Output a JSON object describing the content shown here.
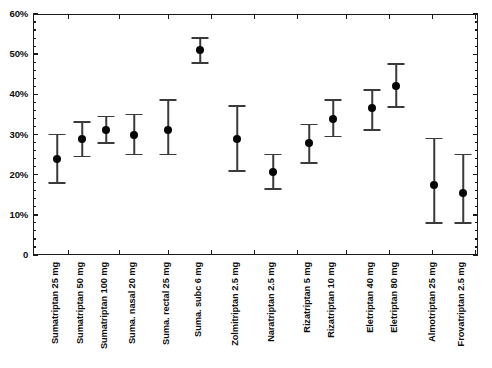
{
  "chart_data": {
    "type": "scatter",
    "title": "",
    "subtitle": "",
    "xlabel": "",
    "ylabel": "",
    "ylim": [
      0,
      60
    ],
    "ytick_values": [
      0,
      10,
      20,
      30,
      40,
      50,
      60
    ],
    "ytick_labels": [
      "0",
      "10%",
      "20%",
      "30%",
      "40%",
      "50%",
      "60%"
    ],
    "yminor_step": 2,
    "grid": false,
    "legend": false,
    "legend_position": "none",
    "error_bar_style": "capped-vertical",
    "marker_color": "#050505",
    "error_bar_color": "#3a3a3a",
    "axis_color": "#1a1a1a",
    "background_color": "#ffffff",
    "categories": [
      "Sumatriptan 25 mg",
      "Sumatriptan 50 mg",
      "Sumatriptan 100 mg",
      "Suma. nasal 20 mg",
      "Suma. rectal 25 mg",
      "Suma. subc 6 mg",
      "Zolmitriptan 2.5 mg",
      "Naratriptan 2.5 mg",
      "Rizatriptan 5 mg",
      "Rizatriptan 10 mg",
      "Eletriptan 40 mg",
      "Eletriptan 80 mg",
      "Almotriptan 25 mg",
      "Frovatriptan 2.5 mg"
    ],
    "values": [
      24.0,
      28.8,
      31.2,
      29.8,
      31.0,
      51.0,
      28.8,
      20.6,
      27.8,
      33.8,
      36.5,
      42.0,
      17.5,
      15.5
    ],
    "ci_low": [
      18.0,
      24.5,
      27.8,
      25.0,
      25.0,
      47.8,
      21.0,
      16.5,
      23.0,
      29.5,
      31.2,
      36.8,
      8.0,
      8.0
    ],
    "ci_high": [
      30.0,
      33.2,
      34.5,
      35.0,
      38.5,
      54.0,
      37.0,
      25.0,
      32.5,
      38.5,
      41.0,
      47.5,
      29.0,
      25.0
    ],
    "points": [
      {
        "category": "Sumatriptan 25 mg",
        "value": 24.0,
        "ci_low": 18.0,
        "ci_high": 30.0
      },
      {
        "category": "Sumatriptan 50 mg",
        "value": 28.8,
        "ci_low": 24.5,
        "ci_high": 33.2
      },
      {
        "category": "Sumatriptan 100 mg",
        "value": 31.2,
        "ci_low": 27.8,
        "ci_high": 34.5
      },
      {
        "category": "Suma. nasal 20 mg",
        "value": 29.8,
        "ci_low": 25.0,
        "ci_high": 35.0
      },
      {
        "category": "Suma. rectal 25 mg",
        "value": 31.0,
        "ci_low": 25.0,
        "ci_high": 38.5
      },
      {
        "category": "Suma. subc 6 mg",
        "value": 51.0,
        "ci_low": 47.8,
        "ci_high": 54.0
      },
      {
        "category": "Zolmitriptan 2.5 mg",
        "value": 28.8,
        "ci_low": 21.0,
        "ci_high": 37.0
      },
      {
        "category": "Naratriptan 2.5 mg",
        "value": 20.6,
        "ci_low": 16.5,
        "ci_high": 25.0
      },
      {
        "category": "Rizatriptan 5 mg",
        "value": 27.8,
        "ci_low": 23.0,
        "ci_high": 32.5
      },
      {
        "category": "Rizatriptan 10 mg",
        "value": 33.8,
        "ci_low": 29.5,
        "ci_high": 38.5
      },
      {
        "category": "Eletriptan 40 mg",
        "value": 36.5,
        "ci_low": 31.2,
        "ci_high": 41.0
      },
      {
        "category": "Eletriptan 80 mg",
        "value": 42.0,
        "ci_low": 36.8,
        "ci_high": 47.5
      },
      {
        "category": "Almotriptan 25 mg",
        "value": 17.5,
        "ci_low": 8.0,
        "ci_high": 29.0
      },
      {
        "category": "Frovatriptan 2.5 mg",
        "value": 15.5,
        "ci_low": 8.0,
        "ci_high": 25.0
      }
    ],
    "x_positions": [
      57,
      82,
      106,
      134,
      168,
      200,
      237,
      273,
      309,
      333,
      372,
      396,
      434,
      463
    ],
    "x_group_tick_positions": [
      68,
      119,
      168,
      211,
      254,
      297,
      346,
      389,
      432,
      475
    ]
  }
}
